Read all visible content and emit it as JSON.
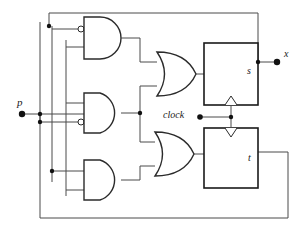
{
  "diagram": {
    "colors": {
      "wire": "#4a4a4a",
      "gate_stroke": "#2b2b2b",
      "box_stroke": "#1a1a1a",
      "node": "#111111",
      "background": "#ffffff"
    },
    "labels": {
      "input_p": "p",
      "output_x": "x",
      "clock": "clock",
      "flipflop_s": "s",
      "flipflop_t": "t"
    },
    "gates": [
      {
        "name": "and-gate-top",
        "type": "AND",
        "inverted_inputs": [
          "top"
        ]
      },
      {
        "name": "and-gate-middle",
        "type": "AND",
        "inverted_inputs": [
          "bottom"
        ]
      },
      {
        "name": "and-gate-bottom",
        "type": "AND",
        "inverted_inputs": []
      },
      {
        "name": "or-gate-top",
        "type": "OR",
        "inverted_inputs": []
      },
      {
        "name": "or-gate-bottom",
        "type": "OR",
        "inverted_inputs": []
      }
    ],
    "flipflops": [
      {
        "name": "flipflop-s",
        "label": "s",
        "clocked": true
      },
      {
        "name": "flipflop-t",
        "label": "t",
        "clocked": true
      }
    ],
    "terminals": [
      {
        "name": "input-terminal-p",
        "label": "p",
        "kind": "input"
      },
      {
        "name": "output-terminal-x",
        "label": "x",
        "kind": "output"
      },
      {
        "name": "clock-terminal",
        "label": "clock",
        "kind": "input"
      }
    ]
  }
}
